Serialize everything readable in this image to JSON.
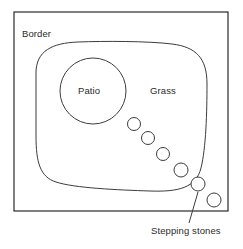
{
  "diagram": {
    "background_color": "#ffffff",
    "line_color": "#3c3c3c",
    "text_color": "#2b2b2b",
    "labels": {
      "border": "Border",
      "patio": "Patio",
      "grass": "Grass",
      "stepping_stones": "Stepping stones"
    },
    "shapes": {
      "border_rect": {
        "x": 14,
        "y": 12,
        "width": 214,
        "height": 199
      },
      "grass_area": {
        "left": 36,
        "top": 42,
        "right": 207,
        "bottom": 192
      },
      "patio_circle": {
        "cx": 93,
        "cy": 91,
        "r": 33
      }
    },
    "stepping_stones": [
      {
        "cx": 134,
        "cy": 124,
        "r": 6.5
      },
      {
        "cx": 148,
        "cy": 138,
        "r": 6.5
      },
      {
        "cx": 163,
        "cy": 154,
        "r": 6.5
      },
      {
        "cx": 181,
        "cy": 170,
        "r": 7
      },
      {
        "cx": 198,
        "cy": 184,
        "r": 7
      },
      {
        "cx": 214,
        "cy": 200,
        "r": 7
      }
    ],
    "leader_line": {
      "x1": 198,
      "y1": 192,
      "x2": 189,
      "y2": 223
    }
  }
}
